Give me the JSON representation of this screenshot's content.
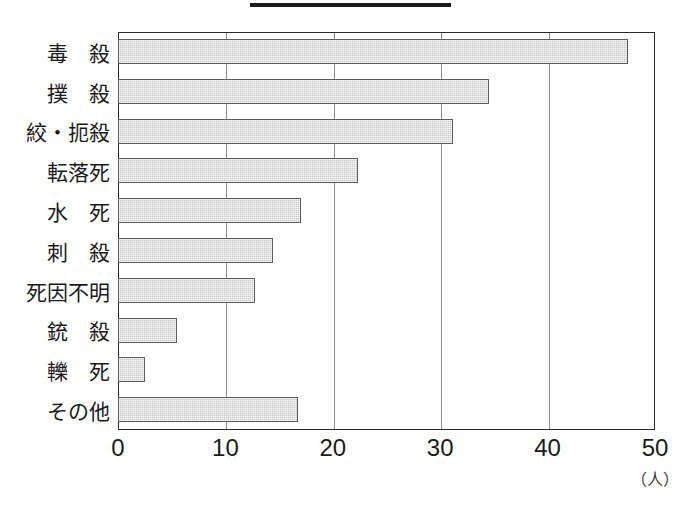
{
  "chart_data": {
    "type": "bar",
    "orientation": "horizontal",
    "title": "",
    "xlabel": "",
    "ylabel": "",
    "unit_label": "（人）",
    "xlim": [
      0,
      50
    ],
    "xticks": [
      "0",
      "10",
      "20",
      "30",
      "40",
      "50"
    ],
    "grid": "vertical",
    "legend": "none",
    "bar_fill_color": "#cbcbcb",
    "bar_border_color": "#5c5c5c",
    "axis_color": "#2a2a2a",
    "categories": [
      "毒　殺",
      "撲　殺",
      "絞・扼殺",
      "転落死",
      "水　死",
      "刺　殺",
      "死因不明",
      "銃　殺",
      "轢　死",
      "その他"
    ],
    "values": [
      47.5,
      34.5,
      31.2,
      22.3,
      17.0,
      14.4,
      12.8,
      5.5,
      2.5,
      16.8
    ]
  }
}
